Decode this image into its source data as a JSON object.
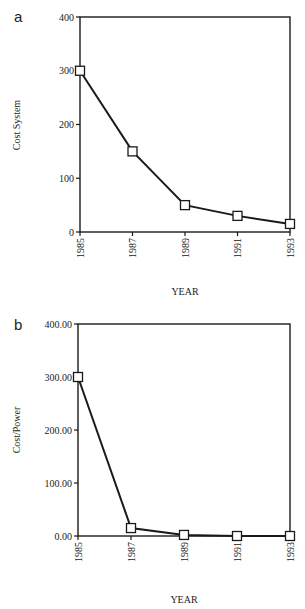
{
  "chart_data": [
    {
      "panel": "a",
      "type": "line",
      "title": "",
      "xlabel": "YEAR",
      "ylabel": "Cost System",
      "categories": [
        "1985",
        "1987",
        "1989",
        "1991",
        "1993"
      ],
      "values": [
        300,
        150,
        50,
        30,
        15
      ],
      "ylim": [
        0,
        400
      ],
      "yticks": [
        "0",
        "100",
        "200",
        "300",
        "400"
      ],
      "marker": "open-square",
      "grid": false
    },
    {
      "panel": "b",
      "type": "line",
      "title": "",
      "xlabel": "YEAR",
      "ylabel": "Cost/Power",
      "categories": [
        "1985",
        "1987",
        "1989",
        "1991",
        "1993"
      ],
      "values": [
        300,
        15,
        2,
        0,
        0
      ],
      "ylim": [
        0,
        400
      ],
      "yticks": [
        "0.00",
        "100.00",
        "200.00",
        "300.00",
        "400.00"
      ],
      "marker": "open-square",
      "grid": false
    }
  ],
  "colors": {
    "line": "#1a1a1a",
    "marker_fill": "#ffffff",
    "background": "#ffffff"
  }
}
